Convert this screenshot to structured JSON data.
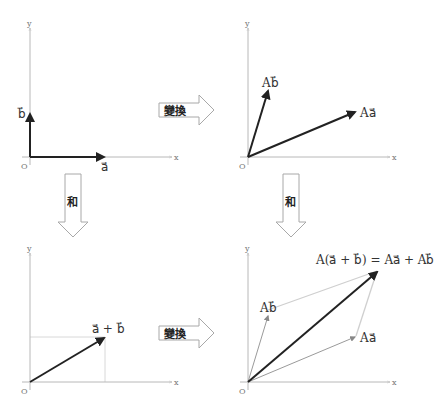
{
  "panels": {
    "top_left": {
      "axis_x": "x",
      "axis_y": "y",
      "origin": "O",
      "vec_a": "a⃗",
      "vec_b": "b⃗"
    },
    "top_right": {
      "axis_x": "x",
      "axis_y": "y",
      "origin": "O",
      "vec_Aa": "Aa⃗",
      "vec_Ab": "Ab⃗"
    },
    "bottom_left": {
      "axis_x": "x",
      "axis_y": "y",
      "origin": "O",
      "vec_sum": "a⃗ + b⃗"
    },
    "bottom_right": {
      "axis_x": "x",
      "axis_y": "y",
      "origin": "O",
      "vec_Aa": "Aa⃗",
      "vec_Ab": "Ab⃗",
      "equation": "A(a⃗ + b⃗) = Aa⃗ + Ab⃗"
    }
  },
  "arrows": {
    "transform_top": "變換",
    "transform_bottom": "變換",
    "sum_left": "和",
    "sum_right": "和"
  },
  "colors": {
    "vector": "#222222",
    "axis": "#b8b8b8",
    "guide": "#d8d8d8"
  }
}
